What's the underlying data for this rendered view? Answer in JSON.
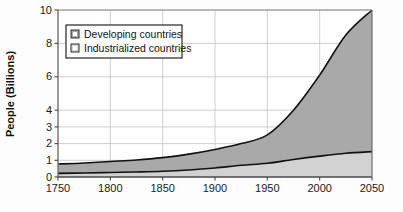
{
  "chart_data": {
    "type": "area",
    "title": "",
    "subtitle": "",
    "xlabel": "",
    "ylabel": "People (Billions)",
    "stacked": true,
    "grid": true,
    "legend_position": "inside-top-left",
    "xlim": [
      1750,
      2050
    ],
    "ylim": [
      0,
      10
    ],
    "xticks": [
      1750,
      1800,
      1850,
      1900,
      1950,
      2000,
      2050
    ],
    "xtick_labels": [
      "1750",
      "1800",
      "1850",
      "1900",
      "1950",
      "2000",
      "2050"
    ],
    "yticks": [
      0,
      1,
      2,
      3,
      4,
      6,
      8,
      10
    ],
    "ytick_labels": [
      "0",
      "1",
      "2",
      "3",
      "4",
      "6",
      "8",
      "10"
    ],
    "x": [
      1750,
      1775,
      1800,
      1825,
      1850,
      1875,
      1900,
      1925,
      1950,
      1975,
      2000,
      2025,
      2050
    ],
    "series": [
      {
        "name": "Industrialized countries",
        "color": "#d2d2d2",
        "values": [
          0.22,
          0.24,
          0.27,
          0.3,
          0.34,
          0.42,
          0.54,
          0.7,
          0.82,
          1.05,
          1.25,
          1.42,
          1.52
        ]
      },
      {
        "name": "Developing countries",
        "color": "#a9a9a9",
        "values": [
          0.56,
          0.6,
          0.66,
          0.72,
          0.82,
          0.95,
          1.11,
          1.3,
          1.7,
          2.95,
          4.85,
          7.08,
          8.48
        ]
      }
    ],
    "totals": [
      0.78,
      0.84,
      0.93,
      1.02,
      1.16,
      1.37,
      1.65,
      2.0,
      2.52,
      4.0,
      6.1,
      8.5,
      10.0
    ],
    "line_color": "#111111"
  },
  "legend": {
    "items": [
      {
        "label": "Developing countries",
        "swatch": "#a9a9a9"
      },
      {
        "label": "Industrialized countries",
        "swatch": "#d9d9d9"
      }
    ]
  },
  "axes": {
    "y_title": "People (Billions)"
  }
}
